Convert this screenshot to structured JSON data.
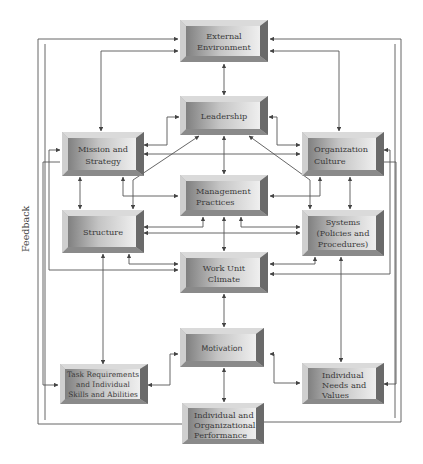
{
  "diagram": {
    "type": "organizational-performance-model",
    "side_label": "Feedback",
    "boxes": [
      {
        "id": "external",
        "lines": [
          "External",
          "Environment"
        ]
      },
      {
        "id": "leadership",
        "lines": [
          "Leadership"
        ]
      },
      {
        "id": "mission",
        "lines": [
          "Mission and",
          "Strategy"
        ]
      },
      {
        "id": "culture",
        "lines": [
          "Organization",
          "Culture"
        ]
      },
      {
        "id": "management",
        "lines": [
          "Management",
          "Practices"
        ]
      },
      {
        "id": "structure",
        "lines": [
          "Structure"
        ]
      },
      {
        "id": "systems",
        "lines": [
          "Systems",
          "(Policies and",
          "Procedures)"
        ]
      },
      {
        "id": "climate",
        "lines": [
          "Work Unit",
          "Climate"
        ]
      },
      {
        "id": "motivation",
        "lines": [
          "Motivation"
        ]
      },
      {
        "id": "task",
        "lines": [
          "Task Requirements",
          "and Individual",
          "Skills and Abilities"
        ]
      },
      {
        "id": "needs",
        "lines": [
          "Individual",
          "Needs and",
          "Values"
        ]
      },
      {
        "id": "performance",
        "lines": [
          "Individual and",
          "Organizational",
          "Performance"
        ]
      }
    ],
    "colors": {
      "box_face_light": "#e8e8e8",
      "box_face_dark": "#8a8a8a",
      "box_bevel_top": "#d6d6d6",
      "box_bevel_right": "#6e6e6e",
      "line": "#555555",
      "text": "#3a3a3a"
    }
  }
}
